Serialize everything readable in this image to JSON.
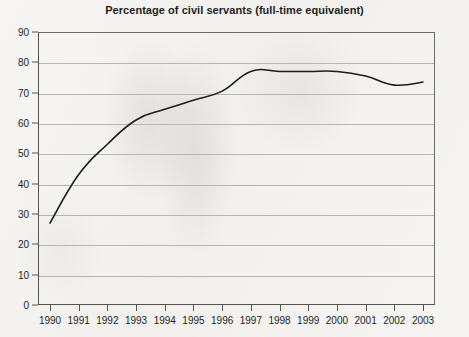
{
  "chart_data": {
    "type": "line",
    "title": "Percentage of civil servants (full-time equivalent)",
    "xlabel": "",
    "ylabel": "",
    "categories": [
      "1990",
      "1991",
      "1992",
      "1993",
      "1994",
      "1995",
      "1996",
      "1997",
      "1998",
      "1999",
      "2000",
      "2001",
      "2002",
      "2003"
    ],
    "values": [
      27,
      43,
      53,
      61,
      64.5,
      67.5,
      70.5,
      77,
      77,
      77,
      77,
      75.5,
      72.5,
      73.5
    ],
    "series": [
      {
        "name": "Percentage of civil servants (full-time equivalent)",
        "values": [
          27,
          43,
          53,
          61,
          64.5,
          67.5,
          70.5,
          77,
          77,
          77,
          77,
          75.5,
          72.5,
          73.5
        ]
      }
    ],
    "ylim": [
      0,
      90
    ],
    "yticks": [
      0,
      10,
      20,
      30,
      40,
      50,
      60,
      70,
      80,
      90
    ],
    "ytick_labels": [
      "0",
      "10",
      "20",
      "30",
      "40",
      "50",
      "60",
      "70",
      "80",
      "90"
    ],
    "grid": "horizontal",
    "legend": "none",
    "line_color": "#1f1c19",
    "gridline_color": "#b9b6b1",
    "axis_color": "#57544f",
    "background_color": "#f4f3f1",
    "text_color": "#231f1c",
    "annotations": []
  }
}
